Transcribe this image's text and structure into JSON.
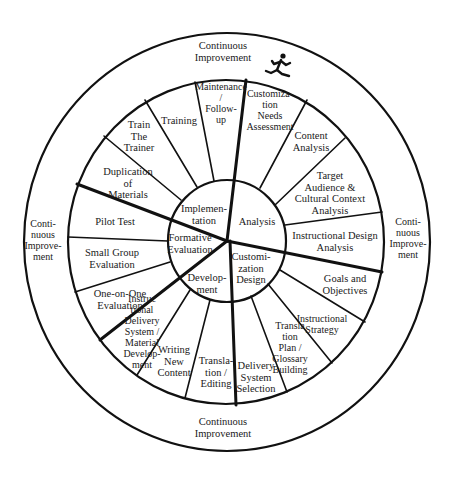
{
  "diagram": {
    "outer_ring": {
      "label_top": "Continuous\nImprovement",
      "label_bottom": "Continuous\nImprovement",
      "label_left": "Conti-\nnuous\nImprove-\nment",
      "label_right": "Conti-\nnuous\nImprove-\nment",
      "icon": "running-person-icon"
    },
    "phases": [
      {
        "name": "Analysis",
        "label": "Analysis"
      },
      {
        "name": "Customization Design",
        "label": "Customi-\nzation\nDesign"
      },
      {
        "name": "Development",
        "label": "Develop-\nment"
      },
      {
        "name": "Formative Evaluation",
        "label": "Formative\nEvaluation"
      },
      {
        "name": "Implementation",
        "label": "Implemen-\ntation"
      }
    ],
    "steps": [
      {
        "phase": "Analysis",
        "label": "Customiza-\n   tion\nNeeds\nAssessment"
      },
      {
        "phase": "Analysis",
        "label": "Content\nAnalysis"
      },
      {
        "phase": "Analysis",
        "label": "Target\nAudience &\nCultural Context\nAnalysis"
      },
      {
        "phase": "Analysis",
        "label": "Instructional Design\nAnalysis"
      },
      {
        "phase": "Customization Design",
        "label": "Goals and\nObjectives"
      },
      {
        "phase": "Customization Design",
        "label": "Instructional\nStrategy"
      },
      {
        "phase": "Customization Design",
        "label": "Transla\ntion\nPlan /\nGlossary\nBuilding"
      },
      {
        "phase": "Customization Design",
        "label": "Delivery\nSystem\nSelection"
      },
      {
        "phase": "Development",
        "label": "Transla-\ntion /\nEditing"
      },
      {
        "phase": "Development",
        "label": "Writing\nNew\nContent"
      },
      {
        "phase": "Development",
        "label": "Instruc\ntional\nDelivery\nSystem /\nMaterial\nDevelop-\nment"
      },
      {
        "phase": "Formative Evaluation",
        "label": "One-on-One\nEvaluation"
      },
      {
        "phase": "Formative Evaluation",
        "label": "Small Group\nEvaluation"
      },
      {
        "phase": "Formative Evaluation",
        "label": "Pilot Test"
      },
      {
        "phase": "Implementation",
        "label": "Duplication\nof\nMaterials"
      },
      {
        "phase": "Implementation",
        "label": "Train\nThe\nTrainer"
      },
      {
        "phase": "Implementation",
        "label": "Training"
      },
      {
        "phase": "Implementation",
        "label": "Maintenance\n/\nFollow-\nup"
      }
    ],
    "colors": {
      "line": "#111111",
      "text": "#1a1a1a",
      "background": "#ffffff"
    }
  }
}
